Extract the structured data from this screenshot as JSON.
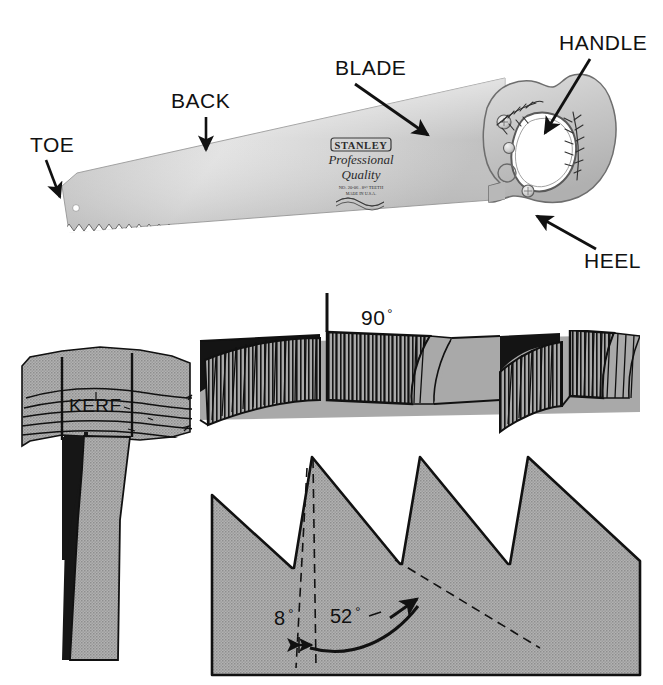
{
  "figure": {
    "background_color": "#ffffff",
    "ink_color": "#111111",
    "halftone_gray": "#a9a9a9",
    "blade_light": "#e4e4e4",
    "blade_dark": "#9c9c9c",
    "handle_gray": "#c8c8c8",
    "dark_shadow": "#161616"
  },
  "saw_photo": {
    "labels": [
      {
        "id": "toe",
        "text": "TOE"
      },
      {
        "id": "back",
        "text": "BACK"
      },
      {
        "id": "blade",
        "text": "BLADE"
      },
      {
        "id": "handle",
        "text": "HANDLE"
      },
      {
        "id": "heel",
        "text": "HEEL"
      }
    ],
    "etch": {
      "brand": "STANLEY",
      "line2": "Professional",
      "line3": "Quality",
      "line4": "NO. 20-06  .  8½ TEETH",
      "line5": "MADE IN U.S.A."
    }
  },
  "kerf_diagram": {
    "label": "KERF"
  },
  "set_diagram": {
    "angle_label": "90",
    "degree_symbol": "°"
  },
  "tooth_diagram": {
    "angle_rake": "8",
    "angle_bevel": "52",
    "degree_symbol": "°"
  }
}
